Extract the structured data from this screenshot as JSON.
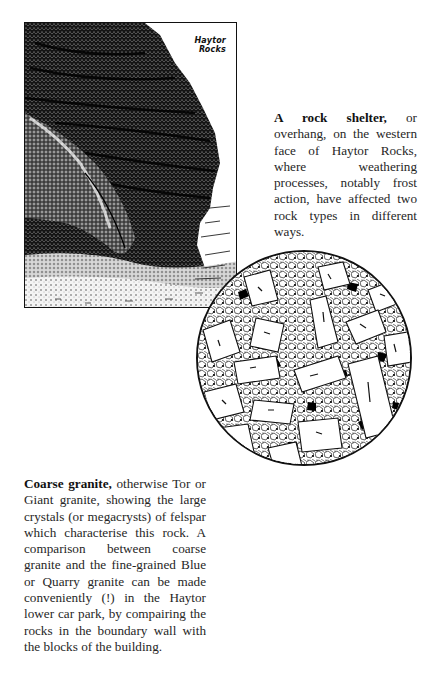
{
  "illustrations": {
    "rock_face": {
      "label_line1": "Haytor",
      "label_line2": "Rocks",
      "description": "Stippled pen drawing of a rock shelter/overhang"
    },
    "granite_texture": {
      "description": "Circular magnified drawing of coarse granite with large felspar megacrysts"
    }
  },
  "captions": {
    "rock_shelter": {
      "bold_lead": "A rock shelter,",
      "text": " or overhang, on the western face of Haytor Rocks, where weathering processes, notably frost action, have affected two rock types in different ways."
    },
    "coarse_granite": {
      "bold_lead": "Coarse granite,",
      "text": " otherwise Tor or Giant granite, showing the large crystals (or megacrysts) of felspar which characterise this rock. A comparison between coarse granite and the fine-grained Blue or Quarry granite can be made conveniently (!) in the Haytor lower car park, by compairing the rocks in the boundary wall with the blocks of the building."
    }
  },
  "colors": {
    "ink": "#111111",
    "paper": "#ffffff",
    "text": "#262626"
  }
}
